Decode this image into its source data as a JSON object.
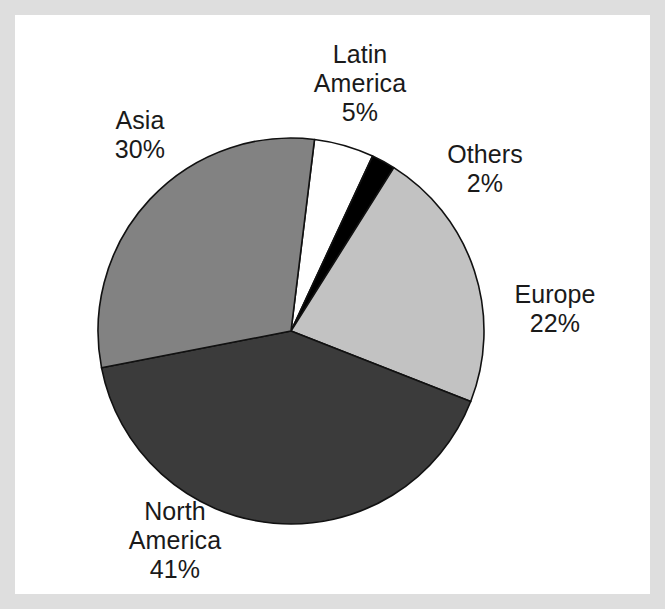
{
  "chart_data": {
    "type": "pie",
    "title": "",
    "subtitle": "",
    "xlabel": "",
    "ylabel": "",
    "legend_position": "none",
    "grid": false,
    "units": "percent",
    "total": 100,
    "start_angle_deg": 7,
    "direction": "clockwise",
    "categories": [
      "Latin America",
      "Others",
      "Europe",
      "North America",
      "Asia"
    ],
    "values": [
      5,
      2,
      22,
      41,
      30
    ],
    "slices": [
      {
        "label": "Latin America",
        "label_line1": "Latin",
        "label_line2": "America",
        "value": 5,
        "value_text": "5%",
        "color": "#ffffff",
        "stroke": "#111111"
      },
      {
        "label": "Others",
        "label_line1": "Others",
        "label_line2": "",
        "value": 2,
        "value_text": "2%",
        "color": "#000000",
        "stroke": "#111111"
      },
      {
        "label": "Europe",
        "label_line1": "Europe",
        "label_line2": "",
        "value": 22,
        "value_text": "22%",
        "color": "#c2c2c2",
        "stroke": "#111111"
      },
      {
        "label": "North America",
        "label_line1": "North",
        "label_line2": "America",
        "value": 41,
        "value_text": "41%",
        "color": "#3b3b3b",
        "stroke": "#111111"
      },
      {
        "label": "Asia",
        "label_line1": "Asia",
        "label_line2": "",
        "value": 30,
        "value_text": "30%",
        "color": "#828282",
        "stroke": "#111111"
      }
    ]
  },
  "figure": {
    "border_color": "#dedede",
    "canvas_color": "#ffffff",
    "text_color": "#1a1a1a"
  },
  "labels": {
    "latin_america": {
      "line1": "Latin",
      "line2": "America",
      "value": "5%"
    },
    "asia": {
      "line1": "Asia",
      "line2": "",
      "value": "30%"
    },
    "others": {
      "line1": "Others",
      "line2": "",
      "value": "2%"
    },
    "europe": {
      "line1": "Europe",
      "line2": "",
      "value": "22%"
    },
    "north_america": {
      "line1": "North",
      "line2": "America",
      "value": "41%"
    }
  }
}
